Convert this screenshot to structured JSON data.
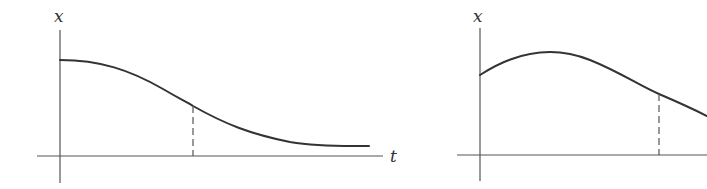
{
  "figure": {
    "panels": [
      {
        "id": "left",
        "y_axis_label": "x",
        "x_axis_label": "t",
        "curve_description": "monotonically decreasing sigmoid-like curve starting at a plateau and decaying toward the t-axis",
        "marker": "vertical dashed line from curve down to t-axis at inflection region"
      },
      {
        "id": "right",
        "y_axis_label": "x",
        "x_axis_label": "",
        "curve_description": "curve rising from a positive start to a maximum, then decreasing",
        "marker": "vertical dashed line from curve down to t-axis on the decreasing part"
      }
    ],
    "colors": {
      "axis": "#555555",
      "curve": "#333333",
      "background": "#ffffff"
    }
  }
}
